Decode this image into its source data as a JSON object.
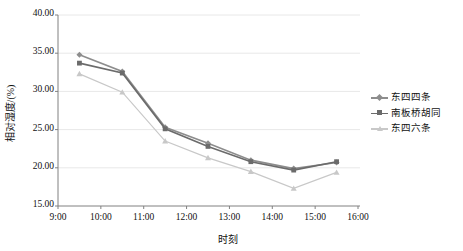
{
  "chart_data": {
    "type": "line",
    "title": "",
    "xlabel": "时刻",
    "ylabel": "相对湿度/(%)",
    "xtick_labels": [
      "9:00",
      "10:00",
      "11:00",
      "12:00",
      "13:00",
      "14:00",
      "15:00",
      "16:00"
    ],
    "ytick_labels": [
      "15.00",
      "20.00",
      "25.00",
      "30.00",
      "35.00",
      "40.00"
    ],
    "ylim": [
      15.0,
      40.0
    ],
    "xlim": [
      "9:00",
      "16:00"
    ],
    "ytick_step": 5.0,
    "grid": "horizontal",
    "legend_position": "right",
    "x": [
      "9:30",
      "10:30",
      "11:30",
      "12:30",
      "13:30",
      "14:30",
      "15:30"
    ],
    "series": [
      {
        "name": "东四四条",
        "color": "#8d8d8d",
        "marker": "diamond",
        "values": [
          34.8,
          32.6,
          25.3,
          23.2,
          21.0,
          19.9,
          20.7
        ]
      },
      {
        "name": "南板桥胡同",
        "color": "#6b6b6b",
        "marker": "square",
        "values": [
          33.7,
          32.4,
          25.1,
          22.8,
          20.8,
          19.7,
          20.8
        ]
      },
      {
        "name": "东四六条",
        "color": "#c8c8c8",
        "marker": "triangle",
        "values": [
          32.3,
          29.9,
          23.5,
          21.3,
          19.5,
          17.3,
          19.4
        ]
      }
    ]
  },
  "colors": {
    "axis": "#808080",
    "grid": "#e8e8e8",
    "text": "#111111",
    "plot_bg": "#ffffff"
  }
}
